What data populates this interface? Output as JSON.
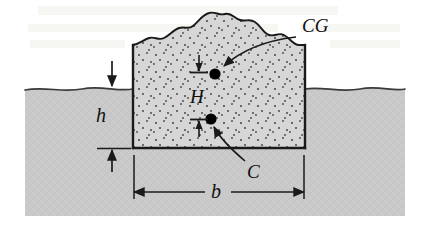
{
  "figure": {
    "type": "engineering-diagram",
    "labels": {
      "cg": "CG",
      "center_of_buoyancy": "C",
      "metacentric_distance": "H",
      "draft": "h",
      "beam": "b"
    },
    "colors": {
      "water_fill": "#c9c9c9",
      "hull_fill": "#d4d4d4",
      "stipple_dot": "#4a4a4a",
      "line": "#1a1a1a",
      "background": "#ffffff",
      "point_marker": "#000000"
    },
    "geometry": {
      "water_surface_y": 88,
      "hull_bottom_y": 148,
      "hull_left_x": 133,
      "hull_right_x": 305,
      "hull_top_y": 45,
      "cg_point": {
        "x": 215,
        "y": 74
      },
      "c_point": {
        "x": 211,
        "y": 119
      },
      "water_region": {
        "x": 25,
        "y": 88,
        "width": 380,
        "height": 128
      },
      "beam_dimension_y": 192,
      "draft_label_x": 104
    },
    "annotations": [
      {
        "name": "cg-leader",
        "from": "CG",
        "to": "cg_point",
        "style": "curved-arrow"
      },
      {
        "name": "c-leader",
        "from": "C",
        "to": "c_point",
        "style": "curved-arrow"
      },
      {
        "name": "h-dimension",
        "style": "double-arrow-outward",
        "label": "H"
      },
      {
        "name": "draft-dimension",
        "style": "double-arrow-outward",
        "label": "h"
      },
      {
        "name": "beam-dimension",
        "style": "double-arrow-inward",
        "label": "b"
      }
    ]
  }
}
